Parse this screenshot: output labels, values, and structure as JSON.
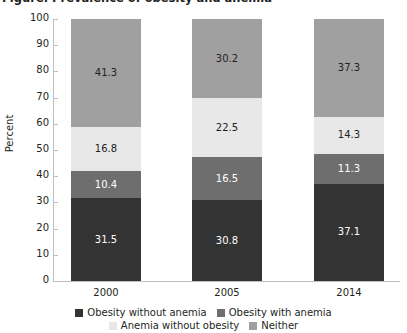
{
  "title_sliver": "Figure. Prevalence of obesity and anemia",
  "axes": {
    "ylabel": "Percent",
    "yticks": [
      "0",
      "10",
      "20",
      "30",
      "40",
      "50",
      "60",
      "70",
      "80",
      "90",
      "100"
    ],
    "xticks": [
      "2000",
      "2005",
      "2014"
    ]
  },
  "legend": {
    "row1": [
      {
        "label": "Obesity without anemia",
        "color": "#333333"
      },
      {
        "label": "Obesity with anemia",
        "color": "#6e6e6e"
      }
    ],
    "row2": [
      {
        "label": "Anemia without obesity",
        "color": "#e8e8e8"
      },
      {
        "label": "Neither",
        "color": "#a0a0a0"
      }
    ]
  },
  "chart_data": {
    "type": "bar",
    "stacked": true,
    "title": "",
    "xlabel": "",
    "ylabel": "Percent",
    "ylim": [
      0,
      100
    ],
    "ytick_step": 10,
    "grid": false,
    "legend_position": "bottom",
    "categories": [
      "2000",
      "2005",
      "2014"
    ],
    "series": [
      {
        "name": "Obesity without anemia",
        "color": "#333333",
        "text_color": "#ffffff",
        "values": [
          31.5,
          30.8,
          37.1
        ]
      },
      {
        "name": "Obesity with anemia",
        "color": "#6e6e6e",
        "text_color": "#ffffff",
        "values": [
          10.4,
          16.5,
          11.3
        ]
      },
      {
        "name": "Anemia without obesity",
        "color": "#e8e8e8",
        "text_color": "#231f20",
        "values": [
          16.8,
          22.5,
          14.3
        ]
      },
      {
        "name": "Neither",
        "color": "#a0a0a0",
        "text_color": "#231f20",
        "values": [
          41.3,
          30.2,
          37.3
        ]
      }
    ]
  }
}
